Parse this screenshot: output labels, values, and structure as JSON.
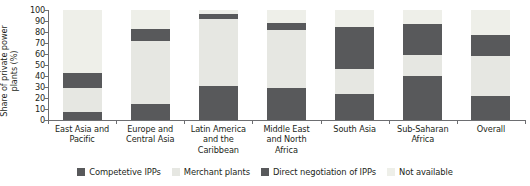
{
  "chart_data": {
    "type": "bar",
    "subtype": "stacked-column",
    "title": "",
    "xlabel": "",
    "ylabel": "Share of private power\nplants (%)",
    "ylim": [
      0,
      100
    ],
    "ytick_step": 10,
    "yticks": [
      "100",
      "90",
      "80",
      "70",
      "60",
      "50",
      "40",
      "30",
      "20",
      "10",
      "0"
    ],
    "grid": false,
    "legend_position": "bottom",
    "categories": [
      "East Asia and\nPacific",
      "Europe and\nCentral Asia",
      "Latin America\nand the\nCaribbean",
      "Middle East\nand North\nAfrica",
      "South Asia",
      "Sub-Saharan\nAfrica",
      "Overall"
    ],
    "series": [
      {
        "name": "Competetive IPPs",
        "color": "#58595b",
        "values": [
          7,
          15,
          31,
          29,
          24,
          40,
          22
        ]
      },
      {
        "name": "Merchant plants",
        "color": "#e6e7e2",
        "values": [
          22,
          57,
          61,
          53,
          22,
          19,
          36
        ]
      },
      {
        "name": "Direct negotiation of IPPs",
        "color": "#58595b",
        "values": [
          14,
          11,
          4,
          6,
          39,
          28,
          19
        ]
      },
      {
        "name": "Not available",
        "color": "#eeefe9",
        "values": [
          57,
          17,
          4,
          12,
          15,
          13,
          23
        ]
      }
    ]
  },
  "legend": {
    "items": [
      {
        "label": "Competetive IPPs",
        "color": "#58595b"
      },
      {
        "label": "Merchant plants",
        "color": "#e6e7e2"
      },
      {
        "label": "Direct negotiation of IPPs",
        "color": "#58595b"
      },
      {
        "label": "Not available",
        "color": "#eeefe9"
      }
    ]
  },
  "axis": {
    "color": "#6d6e71"
  }
}
